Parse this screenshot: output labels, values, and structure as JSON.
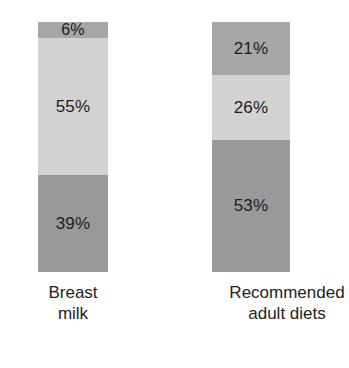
{
  "chart_data": {
    "type": "bar",
    "subtype": "stacked-100-percent",
    "title": "",
    "subtitle": "",
    "xlabel": "",
    "ylabel": "",
    "ylim": [
      0,
      100
    ],
    "grid": false,
    "legend_position": "none",
    "value_suffix": "%",
    "categories": [
      "Breast milk",
      "Recommended adult diets"
    ],
    "category_labels_multiline": [
      "Breast\nmilk",
      "Recommended\nadult diets"
    ],
    "stack_order": "top-to-bottom",
    "series": [
      {
        "name": "top-segment",
        "values": [
          6,
          21
        ],
        "color": "#a6a6a6"
      },
      {
        "name": "middle-segment",
        "values": [
          55,
          26
        ],
        "color": "#d2d2d2"
      },
      {
        "name": "bottom-segment",
        "values": [
          39,
          53
        ],
        "color": "#999999"
      }
    ],
    "bars": [
      {
        "category": "Breast milk",
        "label_line1": "Breast",
        "label_line2": "milk",
        "segments": [
          {
            "value": 6,
            "label": "6%",
            "color": "#a6a6a6"
          },
          {
            "value": 55,
            "label": "55%",
            "color": "#d2d2d2"
          },
          {
            "value": 39,
            "label": "39%",
            "color": "#999999"
          }
        ]
      },
      {
        "category": "Recommended adult diets",
        "label_line1": "Recommended",
        "label_line2": "adult diets",
        "segments": [
          {
            "value": 21,
            "label": "21%",
            "color": "#a6a6a6"
          },
          {
            "value": 26,
            "label": "26%",
            "color": "#d2d2d2"
          },
          {
            "value": 53,
            "label": "53%",
            "color": "#999999"
          }
        ]
      }
    ]
  },
  "colors": {
    "background": "#ffffff",
    "segment_top": "#a6a6a6",
    "segment_middle": "#d2d2d2",
    "segment_bottom": "#999999",
    "text": "#1d1d1d"
  }
}
